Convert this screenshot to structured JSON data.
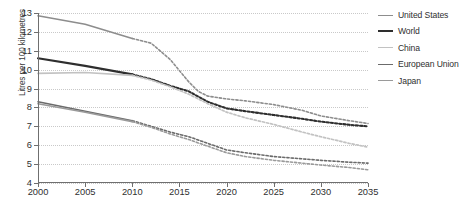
{
  "chart_data": {
    "type": "line",
    "title": "",
    "xlabel": "",
    "ylabel": "Litres per 100 kilometres",
    "xlim": [
      2000,
      2035
    ],
    "ylim": [
      4,
      13
    ],
    "yticks": [
      4,
      5,
      6,
      7,
      8,
      9,
      10,
      11,
      12,
      13
    ],
    "xticks": [
      2000,
      2005,
      2010,
      2015,
      2020,
      2025,
      2030,
      2035
    ],
    "grid": true,
    "legend_position": "right",
    "historical_end": 2010,
    "note": "Solid segments are historical (2000-2010); dashed segments are projections (2010-2035).",
    "x": [
      2000,
      2005,
      2010,
      2015,
      2020,
      2025,
      2030,
      2035
    ],
    "series": [
      {
        "name": "United States",
        "color": "#8d8d8d",
        "width": 1.6,
        "values": [
          12.85,
          12.4,
          11.65,
          10.1,
          8.45,
          8.15,
          7.55,
          7.15
        ],
        "x_dense": [
          2000,
          2005,
          2010,
          2012,
          2014,
          2016,
          2017,
          2018,
          2020,
          2022,
          2025,
          2028,
          2030,
          2033,
          2035
        ],
        "y_dense": [
          12.85,
          12.4,
          11.65,
          11.4,
          10.55,
          9.35,
          8.85,
          8.6,
          8.45,
          8.35,
          8.15,
          7.85,
          7.55,
          7.3,
          7.15
        ]
      },
      {
        "name": "World",
        "color": "#2e2e2e",
        "width": 2.1,
        "values": [
          10.6,
          10.2,
          9.75,
          8.65,
          7.95,
          7.6,
          7.25,
          7.0
        ],
        "x_dense": [
          2000,
          2005,
          2010,
          2012,
          2014,
          2016,
          2018,
          2020,
          2022,
          2025,
          2028,
          2030,
          2033,
          2035
        ],
        "y_dense": [
          10.6,
          10.2,
          9.75,
          9.5,
          9.15,
          8.85,
          8.3,
          7.95,
          7.8,
          7.6,
          7.4,
          7.25,
          7.08,
          7.0
        ]
      },
      {
        "name": "China",
        "color": "#c2c2c2",
        "width": 1.7,
        "values": [
          9.8,
          9.85,
          9.7,
          8.6,
          7.75,
          7.1,
          6.45,
          5.9
        ],
        "x_dense": [
          2000,
          2005,
          2010,
          2012,
          2014,
          2016,
          2018,
          2020,
          2022,
          2025,
          2028,
          2030,
          2033,
          2035
        ],
        "y_dense": [
          9.8,
          9.85,
          9.7,
          9.45,
          9.1,
          8.7,
          8.2,
          7.75,
          7.45,
          7.1,
          6.7,
          6.45,
          6.1,
          5.9
        ]
      },
      {
        "name": "European Union",
        "color": "#6b6b6b",
        "width": 1.6,
        "values": [
          8.3,
          7.8,
          7.3,
          6.4,
          5.75,
          5.4,
          5.2,
          5.05
        ],
        "x_dense": [
          2000,
          2005,
          2010,
          2012,
          2014,
          2016,
          2018,
          2020,
          2022,
          2025,
          2028,
          2030,
          2033,
          2035
        ],
        "y_dense": [
          8.3,
          7.8,
          7.3,
          7.0,
          6.7,
          6.45,
          6.1,
          5.75,
          5.6,
          5.4,
          5.28,
          5.2,
          5.1,
          5.05
        ]
      },
      {
        "name": "Japan",
        "color": "#9a9a9a",
        "width": 1.6,
        "values": [
          8.2,
          7.75,
          7.25,
          6.3,
          5.6,
          5.2,
          4.95,
          4.7
        ],
        "x_dense": [
          2000,
          2005,
          2010,
          2012,
          2014,
          2016,
          2018,
          2020,
          2022,
          2025,
          2028,
          2030,
          2033,
          2035
        ],
        "y_dense": [
          8.2,
          7.75,
          7.25,
          6.95,
          6.6,
          6.3,
          5.95,
          5.6,
          5.4,
          5.2,
          5.05,
          4.95,
          4.82,
          4.7
        ]
      }
    ]
  },
  "legend": {
    "items": [
      {
        "label": "United States"
      },
      {
        "label": "World"
      },
      {
        "label": "China"
      },
      {
        "label": "European Union"
      },
      {
        "label": "Japan"
      }
    ]
  }
}
